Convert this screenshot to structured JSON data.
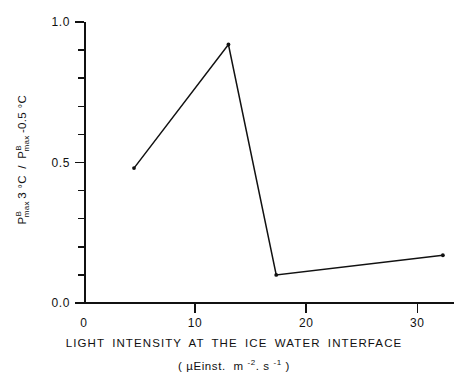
{
  "chart_data": {
    "type": "line",
    "title": "",
    "subtitle": "",
    "xlabel": "LIGHT INTENSITY AT THE ICE WATER INTERFACE",
    "xunits": "( μEinst. m -2. s -1 )",
    "ylabel": "P B max 3 °C / P B max -0.5 °C",
    "ylabel_parts": {
      "numerator_symbol": "P",
      "numerator_sup": "B",
      "numerator_sub": "max",
      "numerator_cond": "3 °C",
      "separator": "/",
      "denominator_symbol": "P",
      "denominator_sup": "B",
      "denominator_sub": "max",
      "denominator_cond": "-0.5 °C"
    },
    "x": [
      4.5,
      13.0,
      17.3,
      32.3
    ],
    "values": [
      0.48,
      0.92,
      0.1,
      0.17
    ],
    "series": [
      {
        "name": "Pmax ratio",
        "x": [
          4.5,
          13.0,
          17.3,
          32.3
        ],
        "values": [
          0.48,
          0.92,
          0.1,
          0.17
        ]
      }
    ],
    "xlim": [
      0,
      33.3
    ],
    "ylim": [
      0.0,
      1.0
    ],
    "xticks": [
      0,
      10,
      20,
      30
    ],
    "xtick_labels": [
      "0",
      "10",
      "20",
      "30"
    ],
    "yticks": [
      0.0,
      0.5,
      1.0
    ],
    "ytick_labels": [
      "0.0",
      "0.5",
      "1.0"
    ],
    "y_minor_ticks": [
      0.1,
      0.2,
      0.3,
      0.4,
      0.6,
      0.7,
      0.8,
      0.9
    ],
    "grid": false,
    "legend": null,
    "line_color": "#111111",
    "marker": "point",
    "background": "#ffffff"
  },
  "axes": {
    "x_axis_name": "light-intensity-axis",
    "y_axis_name": "pmax-ratio-axis"
  }
}
